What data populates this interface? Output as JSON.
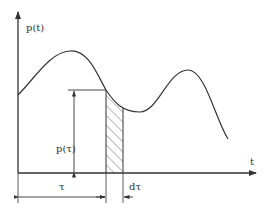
{
  "diagram": {
    "y_axis_label": "p(t)",
    "x_axis_label": "t",
    "ordinate_label": "p(τ)",
    "tau_label": "τ",
    "dtau_label": "dτ",
    "colors": {
      "line": "#333333",
      "background": "#ffffff"
    }
  }
}
